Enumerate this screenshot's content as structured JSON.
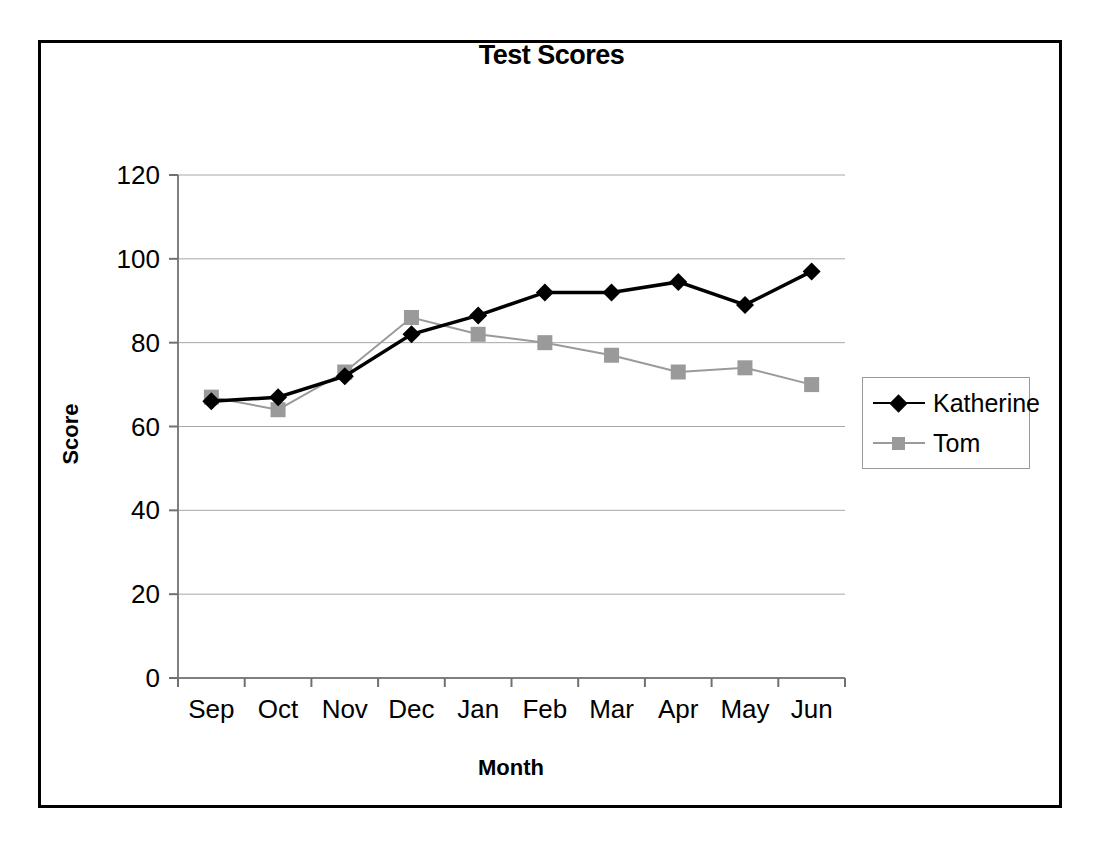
{
  "chart_data": {
    "type": "line",
    "title": "Test Scores",
    "xlabel": "Month",
    "ylabel": "Score",
    "categories": [
      "Sep",
      "Oct",
      "Nov",
      "Dec",
      "Jan",
      "Feb",
      "Mar",
      "Apr",
      "May",
      "Jun"
    ],
    "series": [
      {
        "name": "Katherine",
        "color": "#000000",
        "marker": "diamond",
        "values": [
          66,
          67,
          72,
          82,
          86.5,
          92,
          92,
          94.5,
          89,
          97
        ]
      },
      {
        "name": "Tom",
        "color": "#9a9a9a",
        "marker": "square",
        "values": [
          67,
          64,
          73,
          86,
          82,
          80,
          77,
          73,
          74,
          70
        ]
      }
    ],
    "ylim": [
      0,
      120
    ],
    "yticks": [
      0,
      20,
      40,
      60,
      80,
      100,
      120
    ],
    "ytick_labels": [
      "0",
      "20",
      "40",
      "60",
      "80",
      "100",
      "120"
    ],
    "grid": "horizontal",
    "legend_position": "right"
  },
  "legend": {
    "items": [
      {
        "label": "Katherine"
      },
      {
        "label": "Tom"
      }
    ]
  }
}
